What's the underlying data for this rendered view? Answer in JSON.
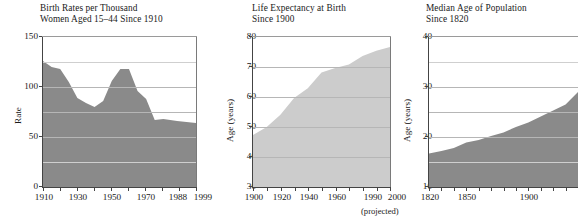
{
  "figure": {
    "background": "#ffffff",
    "panels": [
      "birth-rates",
      "life-expectancy",
      "median-age"
    ]
  },
  "chart_data": [
    {
      "id": "birth-rates",
      "type": "area",
      "title": "Birth Rates per Thousand",
      "subtitle": "Women Aged 15–44 Since 1910",
      "title_line1": "Birth Rates per Thousand",
      "title_line2": "Women Aged 15–44 Since 1910",
      "xlabel": "",
      "ylabel": "Rate",
      "ylim": [
        0,
        150
      ],
      "xlim": [
        1910,
        1999
      ],
      "grid": true,
      "fill_color": "#8a8a8a",
      "yticks": [
        0,
        50,
        100,
        150
      ],
      "ytick_labels": [
        "0",
        "50",
        "100",
        "150"
      ],
      "gridlines": [
        25,
        50,
        75,
        100,
        125
      ],
      "xticks": [
        1910,
        1920,
        1930,
        1940,
        1950,
        1960,
        1970,
        1980,
        1988,
        1999
      ],
      "xtick_labels": [
        "1910",
        "",
        "1930",
        "",
        "1950",
        "",
        "1970",
        "",
        "1988",
        "1999"
      ],
      "x": [
        1910,
        1915,
        1920,
        1925,
        1930,
        1935,
        1940,
        1945,
        1950,
        1955,
        1960,
        1965,
        1970,
        1975,
        1980,
        1988,
        1999
      ],
      "values": [
        126,
        120,
        118,
        105,
        89,
        84,
        80,
        86,
        106,
        118,
        118,
        96,
        88,
        67,
        68,
        66,
        64
      ]
    },
    {
      "id": "life-expectancy",
      "type": "area",
      "title": "Life Expectancy at Birth",
      "subtitle": "Since 1900",
      "title_line1": "Life Expectancy at Birth",
      "title_line2": "Since 1900",
      "xlabel": "",
      "ylabel": "Age (years)",
      "ylim": [
        30,
        80
      ],
      "xlim": [
        1900,
        2000
      ],
      "grid": true,
      "fill_color": "#cccccc",
      "note": "(projected)",
      "yticks": [
        30,
        40,
        50,
        60,
        70,
        80
      ],
      "ytick_labels": [
        "30",
        "40",
        "50",
        "60",
        "70",
        "80"
      ],
      "gridlines": [
        40,
        50,
        60,
        70
      ],
      "xticks": [
        1900,
        1910,
        1920,
        1930,
        1940,
        1950,
        1960,
        1970,
        1980,
        1990,
        2000
      ],
      "xtick_labels": [
        "1900",
        "",
        "1920",
        "",
        "1940",
        "",
        "1960",
        "",
        "",
        "1990",
        "2000"
      ],
      "x": [
        1900,
        1910,
        1920,
        1930,
        1940,
        1950,
        1960,
        1970,
        1980,
        1990,
        2000
      ],
      "values": [
        47.3,
        50.0,
        54.1,
        59.7,
        62.9,
        68.2,
        69.7,
        70.8,
        73.7,
        75.4,
        76.7
      ]
    },
    {
      "id": "median-age",
      "type": "area",
      "title": "Median Age of Population",
      "subtitle": "Since 1820",
      "title_line1": "Median Age of Population",
      "title_line2": "Since 1820",
      "xlabel": "",
      "ylabel": "Age (years)",
      "ylim": [
        10,
        40
      ],
      "xlim": [
        1820,
        1940
      ],
      "grid": true,
      "fill_color": "#8a8a8a",
      "yticks": [
        10,
        20,
        30,
        40
      ],
      "ytick_labels": [
        "10",
        "20",
        "30",
        "40"
      ],
      "gridlines": [
        15,
        20,
        25,
        30,
        35
      ],
      "xticks": [
        1820,
        1830,
        1840,
        1850,
        1860,
        1870,
        1880,
        1890,
        1900,
        1910,
        1920,
        1930,
        1940
      ],
      "xtick_labels": [
        "1820",
        "",
        "",
        "1850",
        "",
        "",
        "",
        "",
        "1900",
        "",
        "",
        "",
        ""
      ],
      "x": [
        1820,
        1830,
        1840,
        1850,
        1860,
        1870,
        1880,
        1890,
        1900,
        1910,
        1920,
        1930,
        1940
      ],
      "values": [
        16.7,
        17.2,
        17.8,
        18.9,
        19.4,
        20.2,
        20.9,
        22.0,
        22.9,
        24.1,
        25.3,
        26.5,
        29.0
      ]
    }
  ]
}
